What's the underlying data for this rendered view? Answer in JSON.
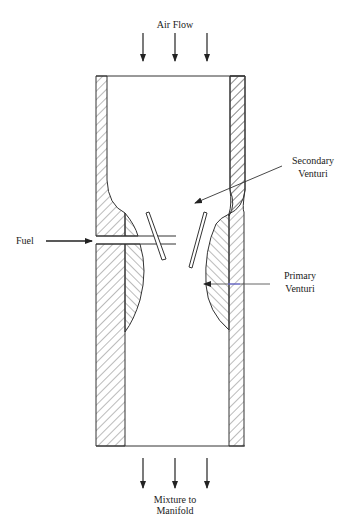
{
  "diagram": {
    "type": "carburetor-venturi-cross-section",
    "labels": {
      "air_flow": "Air Flow",
      "fuel": "Fuel",
      "secondary_venturi_line1": "Secondary",
      "secondary_venturi_line2": "Venturi",
      "primary_venturi_line1": "Primary",
      "primary_venturi_line2": "Venturi",
      "mixture_line1": "Mixture to",
      "mixture_line2": "Manifold"
    },
    "colors": {
      "stroke": "#333333",
      "hatch": "#555555",
      "background": "#ffffff"
    },
    "arrows": {
      "inlet_count": 3,
      "outlet_count": 3
    }
  }
}
